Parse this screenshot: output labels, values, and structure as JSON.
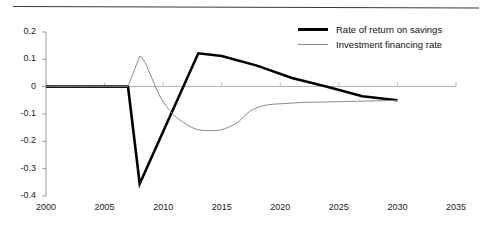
{
  "chart_data": {
    "type": "line",
    "title": "",
    "subtitle": "",
    "xlabel": "",
    "ylabel": "",
    "xlim": [
      2000,
      2035
    ],
    "ylim": [
      -0.4,
      0.2
    ],
    "grid": false,
    "legend_position": "top-right",
    "x_ticks": [
      "2000",
      "2005",
      "2010",
      "2015",
      "2020",
      "2025",
      "2030",
      "2035"
    ],
    "x_tick_values": [
      2000,
      2005,
      2010,
      2015,
      2020,
      2025,
      2030,
      2035
    ],
    "y_ticks": [
      "0.2",
      "0.1",
      "0",
      "-0.1",
      "-0.2",
      "-0.3",
      "-0.4"
    ],
    "y_tick_values": [
      0.2,
      0.1,
      0,
      -0.1,
      -0.2,
      -0.3,
      -0.4
    ],
    "series": [
      {
        "name": "Rate of return on savings",
        "color": "#000000",
        "width": 2.6,
        "x": [
          2000,
          2007,
          2008,
          2013,
          2015,
          2018,
          2021,
          2024,
          2027,
          2030
        ],
        "values": [
          0.0,
          0.0,
          -0.355,
          0.122,
          0.112,
          0.077,
          0.032,
          0.0,
          -0.035,
          -0.05
        ]
      },
      {
        "name": "Investment financing rate",
        "color": "#8a8a8a",
        "width": 1.0,
        "x": [
          2000,
          2007,
          2008,
          2010,
          2012,
          2014,
          2016,
          2018,
          2021,
          2024,
          2027,
          2030
        ],
        "values": [
          0.0,
          0.0,
          0.112,
          -0.055,
          -0.138,
          -0.161,
          -0.14,
          -0.077,
          -0.06,
          -0.056,
          -0.053,
          -0.05
        ]
      }
    ],
    "annotations": []
  },
  "legend": {
    "items": [
      {
        "label": "Rate of return on savings",
        "style": "thick-black"
      },
      {
        "label": "Investment financing rate",
        "style": "thin-gray"
      }
    ]
  }
}
